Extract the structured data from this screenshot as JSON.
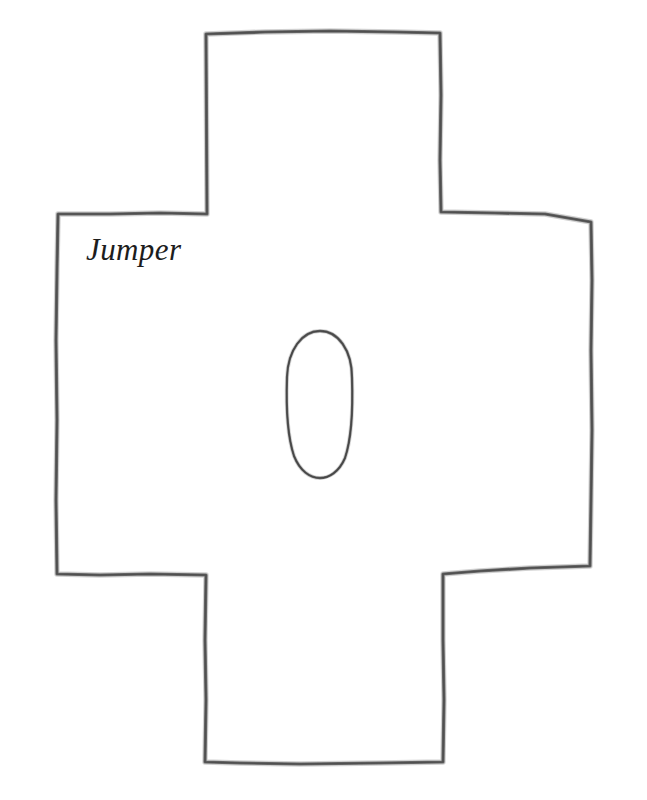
{
  "document": {
    "type": "hand-drawn-sewing-pattern",
    "background_color": "#ffffff",
    "width": 647,
    "height": 800
  },
  "drawing": {
    "outline": {
      "name": "cross-shaped-garment-panel",
      "stroke_color": "#6b6b6b",
      "medium": "pencil"
    },
    "neck_hole": {
      "name": "oval-neck-opening",
      "stroke_color": "#5f5f5f",
      "center_x": 319,
      "center_y": 404,
      "radius_x": 33,
      "radius_y": 73
    }
  },
  "labels": {
    "pattern_name": "Jumper",
    "pattern_name_color": "#1d1d1d"
  }
}
